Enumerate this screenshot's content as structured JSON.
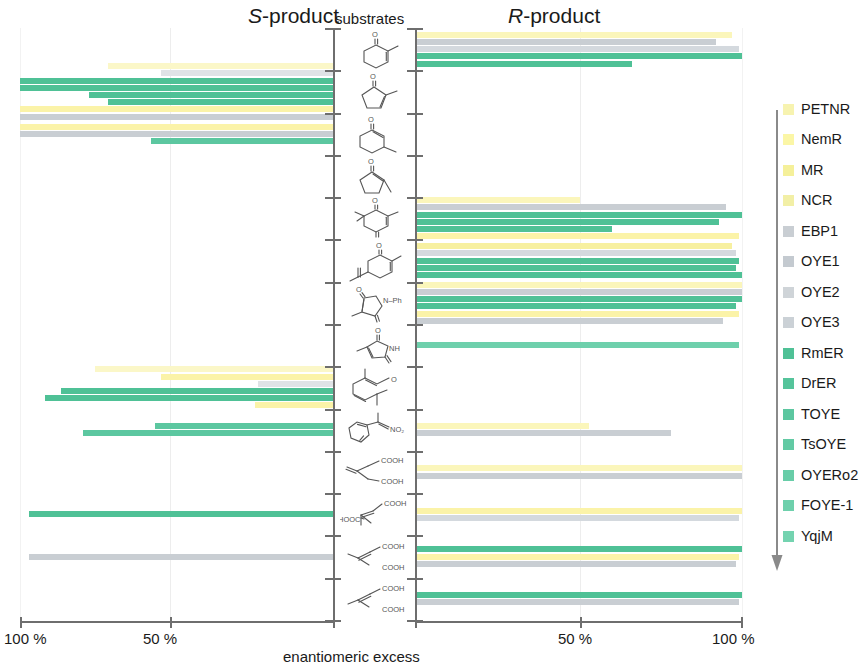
{
  "headers": {
    "left_prefix": "S",
    "left_suffix": "-product",
    "center": "substrates",
    "right_prefix": "R",
    "right_suffix": "-product"
  },
  "axis": {
    "title": "enantiomeric excess",
    "left_outer": "100 %",
    "left_inner": "50 %",
    "right_inner": "50 %",
    "right_outer": "100 %"
  },
  "colors": {
    "yellow": "#fbf7c2",
    "yellow_deep": "#fbf3a8",
    "gray": "#c9ced3",
    "gray_light": "#d8dde1",
    "green": "#4fc196",
    "green_light": "#7ed4b2",
    "axis": "#6e6e6e",
    "text": "#1a1a1a"
  },
  "legend": {
    "arrow_label": "down-arrow",
    "items": [
      {
        "label": "PETNR",
        "color": "#f7f3b0",
        "group": "yellow"
      },
      {
        "label": "NemR",
        "color": "#fbf6a6",
        "group": "yellow"
      },
      {
        "label": "MR",
        "color": "#f5f09a",
        "group": "yellow"
      },
      {
        "label": "NCR",
        "color": "#f2efa6",
        "group": "yellow"
      },
      {
        "label": "EBP1",
        "color": "#c9ced3",
        "group": "gray"
      },
      {
        "label": "OYE1",
        "color": "#c4cad0",
        "group": "gray"
      },
      {
        "label": "OYE2",
        "color": "#cfd4d8",
        "group": "gray"
      },
      {
        "label": "OYE3",
        "color": "#cbd1d6",
        "group": "gray"
      },
      {
        "label": "RmER",
        "color": "#4fc196",
        "group": "green"
      },
      {
        "label": "DrER",
        "color": "#55c49b",
        "group": "green"
      },
      {
        "label": "TOYE",
        "color": "#5cc7a0",
        "group": "green"
      },
      {
        "label": "TsOYE",
        "color": "#62caa4",
        "group": "green"
      },
      {
        "label": "OYERo2",
        "color": "#68cda8",
        "group": "green"
      },
      {
        "label": "FOYE-1",
        "color": "#6ed0ac",
        "group": "green"
      },
      {
        "label": "YqjM",
        "color": "#74d3b0",
        "group": "green"
      }
    ]
  },
  "chart_data": {
    "type": "bar",
    "subtype": "diverging-horizontal-butterfly",
    "xlabel": "enantiomeric excess",
    "ylabel": "substrates",
    "grid": true,
    "legend_position": "right",
    "left_panel": "S-product",
    "right_panel": "R-product",
    "xlim_left": [
      100,
      0
    ],
    "xlim_right": [
      0,
      100
    ],
    "xticks_left": [
      100,
      50
    ],
    "xticks_right": [
      50,
      100
    ],
    "enzymes": [
      "PETNR",
      "NemR",
      "MR",
      "NCR",
      "EBP1",
      "OYE1",
      "OYE2",
      "OYE3",
      "RmER",
      "DrER",
      "TOYE",
      "TsOYE",
      "OYERo2",
      "FOYE-1",
      "YqjM"
    ],
    "substrates": [
      {
        "id": 1,
        "name": "2-methylcyclohex-2-enone"
      },
      {
        "id": 2,
        "name": "2-methylcyclopent-2-enone"
      },
      {
        "id": 3,
        "name": "3-methylcyclohex-2-enone"
      },
      {
        "id": 4,
        "name": "3-methylcyclopent-2-enone"
      },
      {
        "id": 5,
        "name": "4,4,6-trimethylcyclohex-2-ene-1,5-dione (ketoisophorone)"
      },
      {
        "id": 6,
        "name": "carvone"
      },
      {
        "id": 7,
        "name": "2-methyl-N-phenylmaleimide"
      },
      {
        "id": 8,
        "name": "2-methylmaleimide"
      },
      {
        "id": 9,
        "name": "citral"
      },
      {
        "id": 10,
        "name": "(2-nitro-1-propenyl)benzene"
      },
      {
        "id": 11,
        "name": "2-oxo-glutaconic diacid"
      },
      {
        "id": 12,
        "name": "2-methylfumaric acid (mesaconic acid)"
      },
      {
        "id": 13,
        "name": "2-methylmaleic acid (citraconic acid)"
      },
      {
        "id": 14,
        "name": "dimethyl itaconate derivative"
      }
    ],
    "bars": [
      {
        "substrate": 1,
        "side": "right",
        "enzyme": "PETNR",
        "ee": 97,
        "color": "#fbf6bb"
      },
      {
        "substrate": 1,
        "side": "right",
        "enzyme": "EBP1",
        "ee": 92,
        "color": "#c9ced3"
      },
      {
        "substrate": 1,
        "side": "right",
        "enzyme": "OYE1",
        "ee": 99,
        "color": "#d4d9de"
      },
      {
        "substrate": 1,
        "side": "right",
        "enzyme": "RmER",
        "ee": 100,
        "color": "#4fc196"
      },
      {
        "substrate": 1,
        "side": "right",
        "enzyme": "DrER",
        "ee": 66,
        "color": "#4fc196"
      },
      {
        "substrate": 2,
        "side": "left",
        "enzyme": "PETNR",
        "ee": 72,
        "color": "#fbf7c8"
      },
      {
        "substrate": 2,
        "side": "left",
        "enzyme": "OYE1",
        "ee": 55,
        "color": "#dfe3e6"
      },
      {
        "substrate": 2,
        "side": "left",
        "enzyme": "RmER",
        "ee": 100,
        "color": "#4fc196"
      },
      {
        "substrate": 2,
        "side": "left",
        "enzyme": "DrER",
        "ee": 100,
        "color": "#4fc196"
      },
      {
        "substrate": 2,
        "side": "left",
        "enzyme": "TOYE",
        "ee": 78,
        "color": "#4fc196"
      },
      {
        "substrate": 2,
        "side": "left",
        "enzyme": "TsOYE",
        "ee": 72,
        "color": "#4fc196"
      },
      {
        "substrate": 2,
        "side": "left",
        "enzyme": "NemR",
        "ee": 100,
        "color": "#fbf3a8"
      },
      {
        "substrate": 2,
        "side": "left",
        "enzyme": "OYE2",
        "ee": 100,
        "color": "#c9ced3"
      },
      {
        "substrate": 3,
        "side": "left",
        "enzyme": "MR",
        "ee": 100,
        "color": "#fbf3a8"
      },
      {
        "substrate": 3,
        "side": "left",
        "enzyme": "OYE3",
        "ee": 100,
        "color": "#c9ced3"
      },
      {
        "substrate": 3,
        "side": "left",
        "enzyme": "TOYE",
        "ee": 58,
        "color": "#5cc7a0"
      },
      {
        "substrate": 5,
        "side": "right",
        "enzyme": "PETNR",
        "ee": 50,
        "color": "#fbf6bb"
      },
      {
        "substrate": 5,
        "side": "right",
        "enzyme": "EBP1",
        "ee": 95,
        "color": "#c9ced3"
      },
      {
        "substrate": 5,
        "side": "right",
        "enzyme": "RmER",
        "ee": 100,
        "color": "#4fc196"
      },
      {
        "substrate": 5,
        "side": "right",
        "enzyme": "DrER",
        "ee": 93,
        "color": "#4fc196"
      },
      {
        "substrate": 5,
        "side": "right",
        "enzyme": "TOYE",
        "ee": 60,
        "color": "#4fc196"
      },
      {
        "substrate": 5,
        "side": "right",
        "enzyme": "NemR",
        "ee": 99,
        "color": "#fbf3a8"
      },
      {
        "substrate": 6,
        "side": "right",
        "enzyme": "MR",
        "ee": 97,
        "color": "#f7f0a0"
      },
      {
        "substrate": 6,
        "side": "right",
        "enzyme": "OYE1",
        "ee": 98,
        "color": "#d4d9de"
      },
      {
        "substrate": 6,
        "side": "right",
        "enzyme": "RmER",
        "ee": 99,
        "color": "#4fc196"
      },
      {
        "substrate": 6,
        "side": "right",
        "enzyme": "DrER",
        "ee": 98,
        "color": "#4fc196"
      },
      {
        "substrate": 6,
        "side": "right",
        "enzyme": "TOYE",
        "ee": 100,
        "color": "#4fc196"
      },
      {
        "substrate": 7,
        "side": "right",
        "enzyme": "PETNR",
        "ee": 100,
        "color": "#fbf6bb"
      },
      {
        "substrate": 7,
        "side": "right",
        "enzyme": "EBP1",
        "ee": 100,
        "color": "#c9ced3"
      },
      {
        "substrate": 7,
        "side": "right",
        "enzyme": "RmER",
        "ee": 100,
        "color": "#4fc196"
      },
      {
        "substrate": 7,
        "side": "right",
        "enzyme": "DrER",
        "ee": 98,
        "color": "#4fc196"
      },
      {
        "substrate": 7,
        "side": "right",
        "enzyme": "NemR",
        "ee": 99,
        "color": "#fbf3a8"
      },
      {
        "substrate": 7,
        "side": "right",
        "enzyme": "OYE1",
        "ee": 94,
        "color": "#c9ced3"
      },
      {
        "substrate": 8,
        "side": "right",
        "enzyme": "TOYE",
        "ee": 99,
        "color": "#6ed0ac"
      },
      {
        "substrate": 9,
        "side": "left",
        "enzyme": "PETNR",
        "ee": 76,
        "color": "#fbf7c8"
      },
      {
        "substrate": 9,
        "side": "left",
        "enzyme": "NemR",
        "ee": 55,
        "color": "#fbf3a8"
      },
      {
        "substrate": 9,
        "side": "left",
        "enzyme": "OYE1",
        "ee": 24,
        "color": "#dfe3e6"
      },
      {
        "substrate": 9,
        "side": "left",
        "enzyme": "RmER",
        "ee": 87,
        "color": "#4fc196"
      },
      {
        "substrate": 9,
        "side": "left",
        "enzyme": "DrER",
        "ee": 92,
        "color": "#4fc196"
      },
      {
        "substrate": 9,
        "side": "left",
        "enzyme": "MR",
        "ee": 25,
        "color": "#fbf3a8"
      },
      {
        "substrate": 10,
        "side": "right",
        "enzyme": "PETNR",
        "ee": 53,
        "color": "#fbf6bb"
      },
      {
        "substrate": 10,
        "side": "right",
        "enzyme": "EBP1",
        "ee": 78,
        "color": "#c9ced3"
      },
      {
        "substrate": 10,
        "side": "left",
        "enzyme": "TOYE",
        "ee": 57,
        "color": "#5cc7a0"
      },
      {
        "substrate": 10,
        "side": "left",
        "enzyme": "TsOYE",
        "ee": 80,
        "color": "#5cc7a0"
      },
      {
        "substrate": 11,
        "side": "right",
        "enzyme": "PETNR",
        "ee": 100,
        "color": "#fbf6bb"
      },
      {
        "substrate": 11,
        "side": "right",
        "enzyme": "OYE1",
        "ee": 100,
        "color": "#c9ced3"
      },
      {
        "substrate": 12,
        "side": "right",
        "enzyme": "NemR",
        "ee": 100,
        "color": "#fbf3a8"
      },
      {
        "substrate": 12,
        "side": "right",
        "enzyme": "OYE2",
        "ee": 99,
        "color": "#d4d9de"
      },
      {
        "substrate": 12,
        "side": "left",
        "enzyme": "RmER",
        "ee": 97,
        "color": "#4fc196"
      },
      {
        "substrate": 13,
        "side": "right",
        "enzyme": "YqjM",
        "ee": 100,
        "color": "#4fc196"
      },
      {
        "substrate": 13,
        "side": "right",
        "enzyme": "MR",
        "ee": 99,
        "color": "#fbf3a8"
      },
      {
        "substrate": 13,
        "side": "right",
        "enzyme": "OYE3",
        "ee": 98,
        "color": "#c9ced3"
      },
      {
        "substrate": 13,
        "side": "left",
        "enzyme": "OYE3",
        "ee": 97,
        "color": "#c9ced3"
      },
      {
        "substrate": 14,
        "side": "right",
        "enzyme": "YqjM",
        "ee": 100,
        "color": "#4fc196"
      },
      {
        "substrate": 14,
        "side": "right",
        "enzyme": "OYE1",
        "ee": 99,
        "color": "#c9ced3"
      }
    ]
  }
}
